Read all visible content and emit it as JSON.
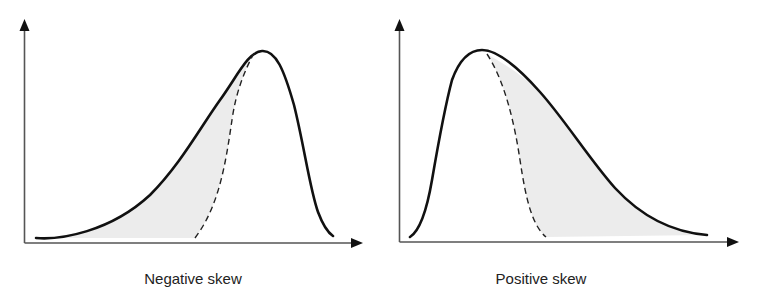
{
  "diagram": {
    "type": "skewness-comparison",
    "panels": [
      {
        "id": "negative",
        "label": "Negative skew",
        "skew_direction": "negative",
        "tail_side": "left",
        "shaded_region": "between skewed curve and symmetric reference (left tail)"
      },
      {
        "id": "positive",
        "label": "Positive skew",
        "skew_direction": "positive",
        "tail_side": "right",
        "shaded_region": "between skewed curve and symmetric reference (right tail)"
      }
    ],
    "legend": {
      "solid_line": "skewed distribution",
      "dashed_line": "symmetric reference half-curve",
      "shaded_area": "skewed tail area"
    },
    "colors": {
      "curve": "#111111",
      "axis": "#555555",
      "shade": "#ececec",
      "text": "#222222"
    }
  }
}
